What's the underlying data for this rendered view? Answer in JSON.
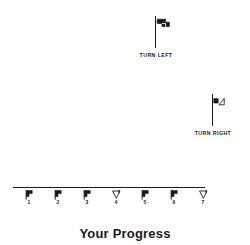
{
  "canvas": {
    "width": 250,
    "height": 245,
    "background": "#ffffff",
    "ink": "#1a1a1a"
  },
  "signposts": [
    {
      "id": "turn-left",
      "caption": "TURN LEFT",
      "icon": "flag-left-icon",
      "direction": "left"
    },
    {
      "id": "turn-right",
      "caption": "TURN RIGHT",
      "icon": "flag-right-icon",
      "direction": "right"
    }
  ],
  "progress": {
    "caption": "Your Progress",
    "track_label": "progress-track",
    "markers": [
      {
        "label": "1",
        "icon": "flag-marker-icon",
        "direction": "left",
        "filled": true
      },
      {
        "label": "2",
        "icon": "flag-marker-icon",
        "direction": "left",
        "filled": true
      },
      {
        "label": "3",
        "icon": "flag-marker-icon",
        "direction": "left",
        "filled": true
      },
      {
        "label": "4",
        "icon": "flag-marker-icon",
        "direction": "right",
        "filled": false
      },
      {
        "label": "5",
        "icon": "flag-marker-icon",
        "direction": "left",
        "filled": true
      },
      {
        "label": "6",
        "icon": "flag-marker-icon",
        "direction": "left",
        "filled": true
      },
      {
        "label": "7",
        "icon": "flag-marker-icon",
        "direction": "right",
        "filled": false
      }
    ]
  }
}
